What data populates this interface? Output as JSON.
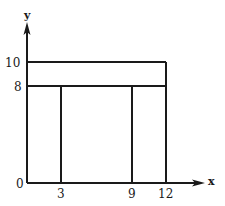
{
  "diagram": {
    "axes": {
      "x_label": "x",
      "y_label": "y",
      "origin_label": "0"
    },
    "x_ticks": [
      "3",
      "9",
      "12"
    ],
    "y_ticks": [
      "10",
      "8"
    ],
    "shapes": [
      {
        "type": "rect",
        "name": "top-beam",
        "x": [
          0,
          12
        ],
        "y": [
          8,
          10
        ]
      },
      {
        "type": "rect",
        "name": "left-leg",
        "x": [
          0,
          3
        ],
        "y": [
          0,
          8
        ]
      },
      {
        "type": "rect",
        "name": "middle-gap",
        "x": [
          3,
          9
        ],
        "y": [
          0,
          8
        ]
      },
      {
        "type": "rect",
        "name": "right-leg",
        "x": [
          9,
          12
        ],
        "y": [
          0,
          8
        ]
      }
    ]
  }
}
